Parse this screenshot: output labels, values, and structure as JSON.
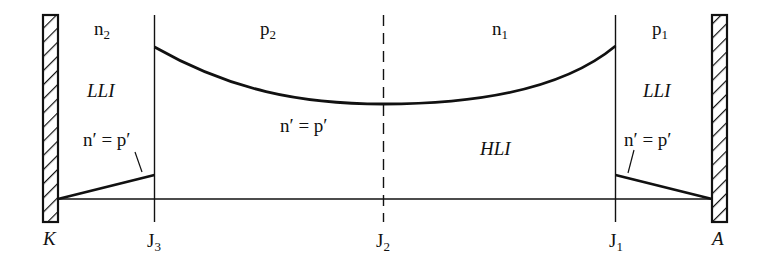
{
  "diagram": {
    "type": "carrier-distribution",
    "colors": {
      "line": "#111111",
      "background": "#ffffff"
    },
    "electrodes": [
      {
        "id": "cathode",
        "label": "K",
        "position": "left"
      },
      {
        "id": "anode",
        "label": "A",
        "position": "right"
      }
    ],
    "junctions": [
      {
        "id": "J3",
        "base": "J",
        "sub": "3",
        "style": "solid"
      },
      {
        "id": "J2",
        "base": "J",
        "sub": "2",
        "style": "dashed"
      },
      {
        "id": "J1",
        "base": "J",
        "sub": "1",
        "style": "solid"
      }
    ],
    "regions": [
      {
        "id": "n2",
        "base": "n",
        "sub": "2"
      },
      {
        "id": "p2",
        "base": "p",
        "sub": "2"
      },
      {
        "id": "n1",
        "base": "n",
        "sub": "1"
      },
      {
        "id": "p1",
        "base": "p",
        "sub": "1"
      }
    ],
    "injection_labels": {
      "left": "LLI",
      "center": "HLI",
      "right": "LLI"
    },
    "curve_labels": {
      "left": "n′ = p′",
      "center": "n′ = p′",
      "right": "n′ = p′"
    }
  }
}
